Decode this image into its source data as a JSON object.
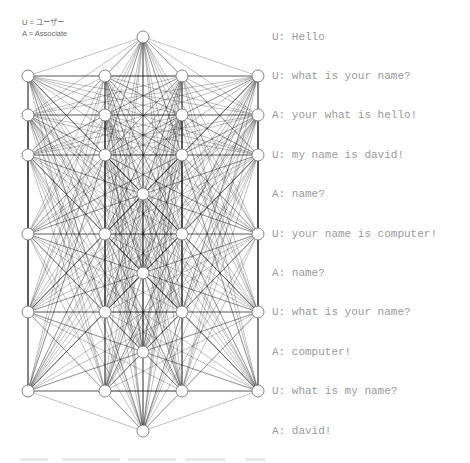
{
  "legend": {
    "user": "U = ユーザー",
    "associate": "A = Associate"
  },
  "network": {
    "node_radius": 6,
    "edge_color": "#1a1a1a",
    "node_stroke": "#777777",
    "nodes": [
      {
        "x": 143,
        "y": 37
      },
      {
        "x": 28,
        "y": 76
      },
      {
        "x": 105,
        "y": 76
      },
      {
        "x": 182,
        "y": 76
      },
      {
        "x": 258,
        "y": 76
      },
      {
        "x": 28,
        "y": 115
      },
      {
        "x": 105,
        "y": 115
      },
      {
        "x": 182,
        "y": 115
      },
      {
        "x": 258,
        "y": 115
      },
      {
        "x": 28,
        "y": 155
      },
      {
        "x": 105,
        "y": 155
      },
      {
        "x": 182,
        "y": 155
      },
      {
        "x": 258,
        "y": 155
      },
      {
        "x": 143,
        "y": 194
      },
      {
        "x": 28,
        "y": 234
      },
      {
        "x": 105,
        "y": 234
      },
      {
        "x": 182,
        "y": 234
      },
      {
        "x": 258,
        "y": 234
      },
      {
        "x": 143,
        "y": 273
      },
      {
        "x": 28,
        "y": 312
      },
      {
        "x": 105,
        "y": 312
      },
      {
        "x": 182,
        "y": 312
      },
      {
        "x": 258,
        "y": 312
      },
      {
        "x": 143,
        "y": 352
      },
      {
        "x": 28,
        "y": 391
      },
      {
        "x": 105,
        "y": 391
      },
      {
        "x": 182,
        "y": 391
      },
      {
        "x": 258,
        "y": 391
      },
      {
        "x": 143,
        "y": 431
      }
    ]
  },
  "chat": {
    "lines": [
      {
        "speaker": "U",
        "text": "U: Hello",
        "y": 37
      },
      {
        "speaker": "U",
        "text": "U: what is your name?",
        "y": 76
      },
      {
        "speaker": "A",
        "text": "A: your what is hello!",
        "y": 115
      },
      {
        "speaker": "U",
        "text": "U: my name is david!",
        "y": 155
      },
      {
        "speaker": "A",
        "text": "A: name?",
        "y": 194
      },
      {
        "speaker": "U",
        "text": "U: your name is computer!",
        "y": 234
      },
      {
        "speaker": "A",
        "text": "A: name?",
        "y": 273
      },
      {
        "speaker": "U",
        "text": "U: what is your name?",
        "y": 312
      },
      {
        "speaker": "A",
        "text": "A: computer!",
        "y": 352
      },
      {
        "speaker": "U",
        "text": "U: what is my name?",
        "y": 391
      },
      {
        "speaker": "A",
        "text": "A: david!",
        "y": 431
      }
    ]
  }
}
